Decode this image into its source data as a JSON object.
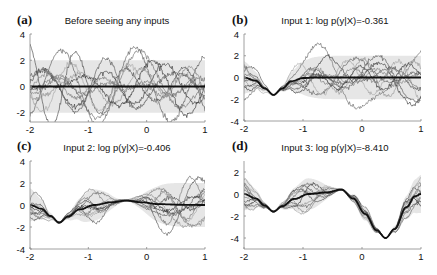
{
  "figure": {
    "colors": {
      "mean": "#111111",
      "band": "#e6e6e6",
      "samples": [
        "#555555",
        "#777777",
        "#999999",
        "#444444",
        "#888888",
        "#666666",
        "#aaaaaa",
        "#3d3d3d",
        "#7a7a7a",
        "#5e5e5e"
      ]
    }
  },
  "chart_data": [
    {
      "id": "a",
      "type": "line",
      "panel_label": "(a)",
      "title": "Before seeing any inputs",
      "xlabel": "",
      "ylabel": "",
      "xlim": [
        -2,
        1
      ],
      "ylim": [
        -2.7,
        4
      ],
      "xticks": [
        -2,
        -1,
        0,
        1
      ],
      "yticks": [
        -2,
        0,
        2,
        4
      ],
      "xtick_labels": [
        "-2",
        "-1",
        "0",
        "1"
      ],
      "ytick_labels": [
        "-2",
        "0",
        "2",
        "4"
      ],
      "observations": [],
      "mean": {
        "x": [
          -2,
          -1,
          0,
          1
        ],
        "y": [
          0,
          0,
          0,
          0
        ]
      },
      "band": {
        "lower": -2,
        "upper": 2,
        "description": "±2 std prior band"
      },
      "n_samples": 10,
      "grid": false,
      "legend": null,
      "box": {
        "left": 30,
        "top": 34,
        "right": 205,
        "bottom": 122
      }
    },
    {
      "id": "b",
      "type": "line",
      "panel_label": "(b)",
      "title": "Input 1: log p(y|X)=-0.361",
      "log_marginal_likelihood": -0.361,
      "xlabel": "",
      "ylabel": "",
      "xlim": [
        -2,
        1
      ],
      "ylim": [
        -4,
        4
      ],
      "xticks": [
        -2,
        -1,
        0,
        1
      ],
      "yticks": [
        -4,
        -2,
        0,
        2,
        4
      ],
      "xtick_labels": [
        "-2",
        "-1",
        "0",
        "1"
      ],
      "ytick_labels": [
        "-4",
        "-2",
        "0",
        "2",
        "4"
      ],
      "observations": [
        {
          "x": -1.5,
          "y": -1.6
        }
      ],
      "mean": {
        "x": [
          -2,
          -1.8,
          -1.65,
          -1.5,
          -1.35,
          -1.2,
          -1.0,
          -0.8,
          0,
          1
        ],
        "y": [
          0,
          -0.3,
          -1.0,
          -1.6,
          -1.0,
          -0.35,
          -0.05,
          0,
          0,
          0
        ]
      },
      "n_samples": 10,
      "grid": false,
      "legend": null,
      "box": {
        "left": 244,
        "top": 34,
        "right": 421,
        "bottom": 121
      }
    },
    {
      "id": "c",
      "type": "line",
      "panel_label": "(c)",
      "title": "Input 2: log p(y|X)=-0.406",
      "log_marginal_likelihood": -0.406,
      "xlabel": "",
      "ylabel": "",
      "xlim": [
        -2,
        1
      ],
      "ylim": [
        -4,
        4
      ],
      "xticks": [
        -2,
        -1,
        0,
        1
      ],
      "yticks": [
        -4,
        -2,
        0,
        2,
        4
      ],
      "xtick_labels": [
        "-2",
        "-1",
        "0",
        "1"
      ],
      "ytick_labels": [
        "-4",
        "-2",
        "0",
        "2",
        "4"
      ],
      "observations": [
        {
          "x": -1.5,
          "y": -1.6
        },
        {
          "x": -0.35,
          "y": 0.4
        }
      ],
      "mean": {
        "x": [
          -2,
          -1.8,
          -1.65,
          -1.5,
          -1.35,
          -1.15,
          -0.9,
          -0.6,
          -0.35,
          -0.1,
          0.2,
          0.6,
          1
        ],
        "y": [
          0,
          -0.35,
          -1.0,
          -1.6,
          -1.05,
          -0.4,
          0.0,
          0.25,
          0.4,
          0.25,
          0.08,
          0.02,
          0
        ]
      },
      "n_samples": 10,
      "grid": false,
      "legend": null,
      "box": {
        "left": 30,
        "top": 161,
        "right": 205,
        "bottom": 249
      }
    },
    {
      "id": "d",
      "type": "line",
      "panel_label": "(d)",
      "title": "Input 3: log p(y|X)=-8.410",
      "log_marginal_likelihood": -8.41,
      "xlabel": "",
      "ylabel": "",
      "xlim": [
        -2,
        1
      ],
      "ylim": [
        -5,
        3
      ],
      "xticks": [
        -2,
        -1,
        0,
        1
      ],
      "yticks": [
        -4,
        -2,
        0,
        2
      ],
      "xtick_labels": [
        "-2",
        "-1",
        "0",
        "1"
      ],
      "ytick_labels": [
        "-4",
        "-2",
        "0",
        "2"
      ],
      "observations": [
        {
          "x": -1.5,
          "y": -1.6
        },
        {
          "x": -0.35,
          "y": 0.4
        },
        {
          "x": 0.4,
          "y": -4.0
        }
      ],
      "mean": {
        "x": [
          -2,
          -1.8,
          -1.65,
          -1.5,
          -1.35,
          -1.15,
          -0.9,
          -0.6,
          -0.35,
          -0.15,
          0.05,
          0.25,
          0.4,
          0.55,
          0.75,
          0.9,
          1
        ],
        "y": [
          0,
          -0.4,
          -1.05,
          -1.6,
          -1.1,
          -0.45,
          0.0,
          0.15,
          0.4,
          -0.4,
          -1.8,
          -3.3,
          -4.0,
          -3.2,
          -1.2,
          -0.2,
          0
        ]
      },
      "n_samples": 10,
      "grid": false,
      "legend": null,
      "box": {
        "left": 244,
        "top": 161,
        "right": 421,
        "bottom": 249
      }
    }
  ]
}
